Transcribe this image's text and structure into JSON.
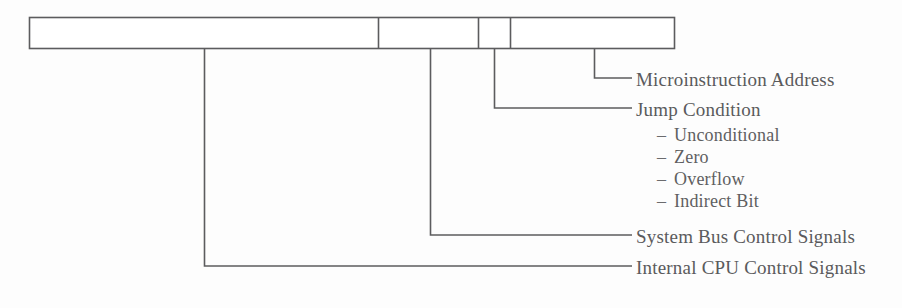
{
  "figure": {
    "type": "bit-field-format-diagram",
    "background_color": "#fdfdfd",
    "line_color": "#5c5c5e",
    "text_color": "#5a5a5c"
  },
  "field_box": {
    "x": 29,
    "y": 17,
    "width": 646,
    "height": 32,
    "divider_positions": [
      378,
      478,
      510
    ],
    "fields": [
      {
        "name": "internal-cpu-control-signals",
        "start": 29,
        "end": 378
      },
      {
        "name": "system-bus-control-signals",
        "start": 378,
        "end": 478
      },
      {
        "name": "jump-condition",
        "start": 478,
        "end": 510
      },
      {
        "name": "microinstruction-address",
        "start": 510,
        "end": 675
      }
    ]
  },
  "callouts": [
    {
      "id": "microinstruction-address",
      "label": "Microinstruction Address",
      "leader_x": 594,
      "leader_y": 78,
      "leader_end_x": 632,
      "label_x": 636,
      "label_y": 78
    },
    {
      "id": "jump-condition",
      "label": "Jump Condition",
      "leader_x": 494,
      "leader_y": 108,
      "leader_end_x": 632,
      "label_x": 636,
      "label_y": 108
    },
    {
      "id": "system-bus-control-signals",
      "label": "System Bus Control Signals",
      "leader_x": 430,
      "leader_y": 235,
      "leader_end_x": 632,
      "label_x": 636,
      "label_y": 235
    },
    {
      "id": "internal-cpu-control-signals",
      "label": "Internal CPU Control Signals",
      "leader_x": 204,
      "leader_y": 266,
      "leader_end_x": 632,
      "label_x": 636,
      "label_y": 266
    }
  ],
  "jump_condition_options": {
    "dash_glyph": "–",
    "dash_x": 657,
    "text_x": 674,
    "first_y": 133,
    "line_height": 22,
    "items": [
      "Unconditional",
      "Zero",
      "Overflow",
      "Indirect Bit"
    ]
  }
}
